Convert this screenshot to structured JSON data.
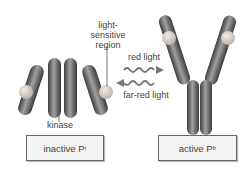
{
  "diagram": {
    "labels": {
      "light_sensitive_region": [
        "light-",
        "sensitive",
        "region"
      ],
      "kinase": "kinase",
      "red_light": "red light",
      "far_red_light": "far-red light"
    },
    "states": [
      {
        "name": "inactive",
        "label": "inactive P",
        "subscript": "r"
      },
      {
        "name": "active",
        "label": "active P",
        "subscript": "fr"
      }
    ],
    "colors": {
      "protein": "#5a5a5a",
      "protein_highlight": "#9a9a9a",
      "chromophore": "#d8d0c8",
      "arrow": "#777777",
      "box_border": "#666666",
      "box_fill": "#f4f4f4"
    }
  }
}
